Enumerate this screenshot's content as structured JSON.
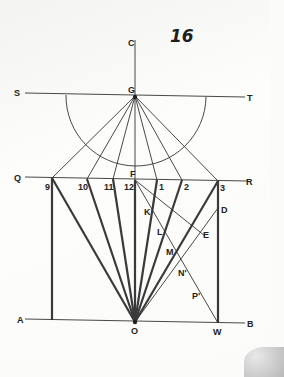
{
  "page_number": "16",
  "labels": {
    "C": "C",
    "S": "S",
    "G": "G",
    "T": "T",
    "Q": "Q",
    "F": "F",
    "R": "R",
    "A": "A",
    "O": "O",
    "W": "W",
    "B": "B",
    "D": "D",
    "E": "E",
    "K": "K",
    "L": "L",
    "M": "M",
    "N": "N'",
    "P": "P'"
  },
  "hours": {
    "h9": "9",
    "h10": "10",
    "h11": "11",
    "h12": "12",
    "h1": "1",
    "h2": "2",
    "h3": "3"
  },
  "colors": {
    "line": "#333333",
    "thick_line": "#3a3a3a",
    "background": "#fbfbfa"
  }
}
